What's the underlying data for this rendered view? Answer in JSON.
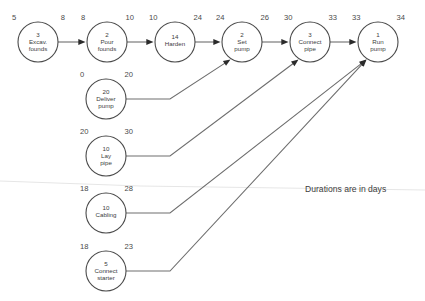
{
  "diagram": {
    "caption": "Durations are in days",
    "nodes": [
      {
        "id": "excav-founds",
        "name_line1": "Excav.",
        "name_line2": "founds",
        "duration": "3",
        "early_start": "5",
        "early_finish": "8",
        "cx": 38,
        "cy": 42,
        "r": 20
      },
      {
        "id": "pour-founds",
        "name_line1": "Pour",
        "name_line2": "founds",
        "duration": "2",
        "early_start": "8",
        "early_finish": "10",
        "cx": 107,
        "cy": 42,
        "r": 20
      },
      {
        "id": "harden",
        "name_line1": "Harden",
        "name_line2": "",
        "duration": "14",
        "early_start": "10",
        "early_finish": "24",
        "cx": 175,
        "cy": 42,
        "r": 20
      },
      {
        "id": "set-pump",
        "name_line1": "Set",
        "name_line2": "pump",
        "duration": "2",
        "early_start": "24",
        "early_finish": "26",
        "cx": 242,
        "cy": 42,
        "r": 20
      },
      {
        "id": "connect-pipe",
        "name_line1": "Connect",
        "name_line2": "pipe",
        "duration": "3",
        "early_start": "30",
        "early_finish": "33",
        "cx": 310,
        "cy": 42,
        "r": 20
      },
      {
        "id": "run-pump",
        "name_line1": "Run",
        "name_line2": "pump",
        "duration": "1",
        "early_start": "33",
        "early_finish": "34",
        "cx": 378,
        "cy": 42,
        "r": 20
      },
      {
        "id": "deliver-pump",
        "name_line1": "Deliver",
        "name_line2": "pump",
        "duration": "20",
        "early_start": "0",
        "early_finish": "20",
        "cx": 106,
        "cy": 99,
        "r": 20
      },
      {
        "id": "lay-pipe",
        "name_line1": "Lay",
        "name_line2": "pipe",
        "duration": "10",
        "early_start": "20",
        "early_finish": "30",
        "cx": 106,
        "cy": 156,
        "r": 20
      },
      {
        "id": "cabling",
        "name_line1": "Cabling",
        "name_line2": "",
        "duration": "10",
        "early_start": "18",
        "early_finish": "28",
        "cx": 106,
        "cy": 213,
        "r": 20
      },
      {
        "id": "connect-starter",
        "name_line1": "Connect",
        "name_line2": "starter",
        "duration": "5",
        "early_start": "18",
        "early_finish": "23",
        "cx": 106,
        "cy": 271,
        "r": 20
      }
    ],
    "edges": [
      {
        "id": "excav-to-pour",
        "from": "excav-founds",
        "to": "pour-founds",
        "kind": "straight"
      },
      {
        "id": "pour-to-harden",
        "from": "pour-founds",
        "to": "harden",
        "kind": "straight"
      },
      {
        "id": "harden-to-set-pump",
        "from": "harden",
        "to": "set-pump",
        "kind": "straight"
      },
      {
        "id": "set-pump-to-connect-pipe",
        "from": "set-pump",
        "to": "connect-pipe",
        "kind": "straight"
      },
      {
        "id": "connect-pipe-to-run-pump",
        "from": "connect-pipe",
        "to": "run-pump",
        "kind": "straight"
      },
      {
        "id": "deliver-pump-to-set-pump",
        "from": "deliver-pump",
        "to": "set-pump",
        "kind": "elbow"
      },
      {
        "id": "lay-pipe-to-connect-pipe",
        "from": "lay-pipe",
        "to": "connect-pipe",
        "kind": "elbow"
      },
      {
        "id": "cabling-to-run-pump",
        "from": "cabling",
        "to": "run-pump",
        "kind": "elbow"
      },
      {
        "id": "connect-starter-to-run-pump",
        "from": "connect-starter",
        "to": "run-pump",
        "kind": "elbow"
      }
    ]
  },
  "chart_data": {
    "type": "diagram",
    "subtype": "activity-on-node-network",
    "annotations": [
      "Durations are in days"
    ],
    "node_fields": [
      "early_start",
      "duration",
      "activity_name",
      "early_finish"
    ],
    "nodes": [
      {
        "activity": "Excav. founds",
        "duration": 3,
        "early_start": 5,
        "early_finish": 8
      },
      {
        "activity": "Pour founds",
        "duration": 2,
        "early_start": 8,
        "early_finish": 10
      },
      {
        "activity": "Harden",
        "duration": 14,
        "early_start": 10,
        "early_finish": 24
      },
      {
        "activity": "Set pump",
        "duration": 2,
        "early_start": 24,
        "early_finish": 26
      },
      {
        "activity": "Connect pipe",
        "duration": 3,
        "early_start": 30,
        "early_finish": 33
      },
      {
        "activity": "Run pump",
        "duration": 1,
        "early_start": 33,
        "early_finish": 34
      },
      {
        "activity": "Deliver pump",
        "duration": 20,
        "early_start": 0,
        "early_finish": 20
      },
      {
        "activity": "Lay pipe",
        "duration": 10,
        "early_start": 20,
        "early_finish": 30
      },
      {
        "activity": "Cabling",
        "duration": 10,
        "early_start": 18,
        "early_finish": 28
      },
      {
        "activity": "Connect starter",
        "duration": 5,
        "early_start": 18,
        "early_finish": 23
      }
    ],
    "edges": [
      [
        "Excav. founds",
        "Pour founds"
      ],
      [
        "Pour founds",
        "Harden"
      ],
      [
        "Harden",
        "Set pump"
      ],
      [
        "Set pump",
        "Connect pipe"
      ],
      [
        "Connect pipe",
        "Run pump"
      ],
      [
        "Deliver pump",
        "Set pump"
      ],
      [
        "Lay pipe",
        "Connect pipe"
      ],
      [
        "Cabling",
        "Run pump"
      ],
      [
        "Connect starter",
        "Run pump"
      ]
    ]
  }
}
